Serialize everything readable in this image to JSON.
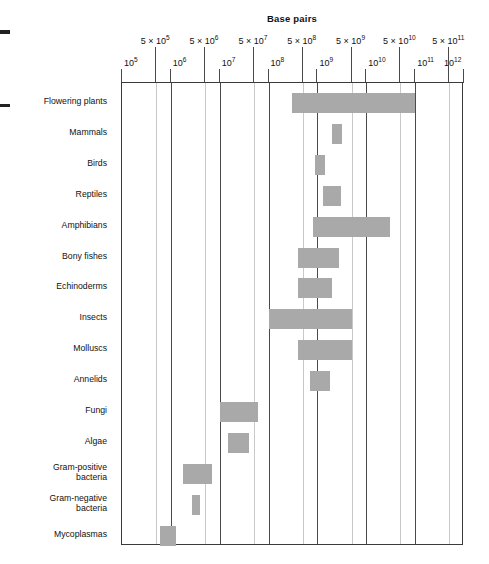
{
  "chart_data": {
    "type": "bar",
    "orientation": "horizontal-range",
    "title": "Base pairs",
    "xlabel": "Base pairs",
    "ylabel": "",
    "xscale": "log",
    "xlim": [
      100000,
      1000000000000
    ],
    "grid": true,
    "legend": false,
    "bar_color": "#a9a9a9",
    "axis_color": "#3a3a3a",
    "minor_grid_color": "#c9c9c9",
    "major_tick_labels": [
      "10^5",
      "10^6",
      "10^7",
      "10^8",
      "10^9",
      "10^10",
      "10^11",
      "10^12"
    ],
    "major_tick_values": [
      100000,
      1000000,
      10000000,
      100000000,
      1000000000,
      10000000000,
      100000000000,
      1000000000000
    ],
    "minor_tick_labels": [
      "5 × 10^5",
      "5 × 10^6",
      "5 × 10^7",
      "5 × 10^8",
      "5 × 10^9",
      "5 × 10^10",
      "5 × 10^11"
    ],
    "minor_tick_values": [
      500000,
      5000000,
      50000000,
      500000000,
      5000000000,
      50000000000,
      500000000000
    ],
    "categories": [
      "Flowering plants",
      "Mammals",
      "Birds",
      "Reptiles",
      "Amphibians",
      "Bony fishes",
      "Echinoderms",
      "Insects",
      "Molluscs",
      "Annelids",
      "Fungi",
      "Algae",
      "Gram-positive\nbacteria",
      "Gram-negative\nbacteria",
      "Mycoplasmas"
    ],
    "ranges": [
      {
        "category": "Flowering plants",
        "min": 300000000,
        "max": 100000000000
      },
      {
        "category": "Mammals",
        "min": 2000000000,
        "max": 3200000000
      },
      {
        "category": "Birds",
        "min": 900000000,
        "max": 1400000000
      },
      {
        "category": "Reptiles",
        "min": 1300000000,
        "max": 3000000000
      },
      {
        "category": "Amphibians",
        "min": 800000000,
        "max": 30000000000
      },
      {
        "category": "Bony fishes",
        "min": 400000000,
        "max": 2800000000
      },
      {
        "category": "Echinoderms",
        "min": 400000000,
        "max": 2000000000
      },
      {
        "category": "Insects",
        "min": 100000000,
        "max": 5000000000
      },
      {
        "category": "Molluscs",
        "min": 400000000,
        "max": 5000000000
      },
      {
        "category": "Annelids",
        "min": 700000000,
        "max": 1800000000
      },
      {
        "category": "Fungi",
        "min": 10000000,
        "max": 60000000
      },
      {
        "category": "Algae",
        "min": 15000000,
        "max": 40000000
      },
      {
        "category": "Gram-positive\nbacteria",
        "min": 1800000,
        "max": 7000000
      },
      {
        "category": "Gram-negative\nbacteria",
        "min": 2700000,
        "max": 4000000
      },
      {
        "category": "Mycoplasmas",
        "min": 600000,
        "max": 1300000
      }
    ]
  },
  "axis": {
    "title": "Base pairs",
    "major": [
      {
        "label_base": "10",
        "label_exp": "5"
      },
      {
        "label_base": "10",
        "label_exp": "6"
      },
      {
        "label_base": "10",
        "label_exp": "7"
      },
      {
        "label_base": "10",
        "label_exp": "8"
      },
      {
        "label_base": "10",
        "label_exp": "9"
      },
      {
        "label_base": "10",
        "label_exp": "10"
      },
      {
        "label_base": "10",
        "label_exp": "11"
      },
      {
        "label_base": "10",
        "label_exp": "12"
      }
    ],
    "minor": [
      {
        "label_base": "5 × 10",
        "label_exp": "5"
      },
      {
        "label_base": "5 × 10",
        "label_exp": "6"
      },
      {
        "label_base": "5 × 10",
        "label_exp": "7"
      },
      {
        "label_base": "5 × 10",
        "label_exp": "8"
      },
      {
        "label_base": "5 × 10",
        "label_exp": "9"
      },
      {
        "label_base": "5 × 10",
        "label_exp": "10"
      },
      {
        "label_base": "5 × 10",
        "label_exp": "11"
      }
    ]
  }
}
